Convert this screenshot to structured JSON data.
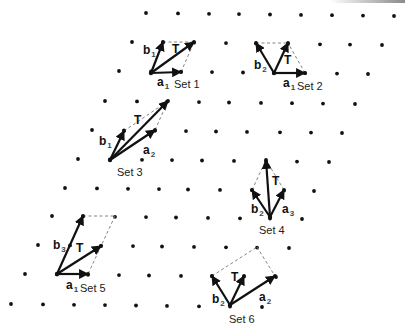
{
  "figure": {
    "width": 405,
    "height": 332,
    "colors": {
      "ink": "#111111",
      "dash": "#777777",
      "label": "#222222"
    },
    "lattice_rows": [
      {
        "y0": 13,
        "x": [
          146,
          178,
          209,
          239,
          270,
          301,
          332,
          363,
          394
        ]
      },
      {
        "y0": 42,
        "x": [
          132,
          163,
          194,
          226,
          256,
          288,
          320,
          350,
          382
        ]
      },
      {
        "y0": 71,
        "x": [
          119,
          151,
          181,
          212,
          243,
          274,
          305,
          337,
          368
        ]
      },
      {
        "y0": 101,
        "x": [
          105,
          137,
          167,
          199,
          229,
          261,
          292,
          323,
          355
        ]
      },
      {
        "y0": 130,
        "x": [
          92,
          124,
          155,
          186,
          216,
          247,
          280,
          311,
          342
        ]
      },
      {
        "y0": 159,
        "x": [
          78,
          110,
          142,
          172,
          202,
          234,
          266,
          297,
          329
        ]
      },
      {
        "y0": 188,
        "x": [
          65,
          97,
          128,
          159,
          188,
          220,
          252,
          284,
          314
        ]
      },
      {
        "y0": 216,
        "x": [
          52,
          83,
          115,
          146,
          176,
          208,
          240,
          270,
          302
        ]
      },
      {
        "y0": 245,
        "x": [
          38,
          70,
          101,
          133,
          162,
          194,
          226,
          257,
          289
        ]
      },
      {
        "y0": 274,
        "x": [
          25,
          57,
          88,
          119,
          149,
          181,
          212,
          244,
          276
        ]
      },
      {
        "y0": 304,
        "x": [
          11,
          43,
          74,
          105,
          136,
          167,
          199,
          230,
          262
        ]
      }
    ],
    "row_slope": 0.012,
    "sets": [
      {
        "label": "Set 1",
        "label_pos": [
          174,
          88
        ],
        "origin": [
          151,
          73
        ],
        "vectors": [
          {
            "name": "a",
            "sub": "1",
            "end": [
              181,
              72
            ],
            "label_pos": [
              157,
              86
            ]
          },
          {
            "name": "b",
            "sub": "1",
            "end": [
              163,
              42
            ],
            "label_pos": [
              143,
              54
            ]
          },
          {
            "name": "T",
            "sub": "",
            "end": [
              194,
              42
            ],
            "label_pos": [
              172,
              53
            ]
          }
        ],
        "dashed": [
          [
            [
              163,
              42
            ],
            [
              194,
              42
            ]
          ],
          [
            [
              181,
              72
            ],
            [
              194,
              42
            ]
          ]
        ]
      },
      {
        "label": "Set 2",
        "label_pos": [
          297,
          90
        ],
        "origin": [
          274,
          73
        ],
        "vectors": [
          {
            "name": "a",
            "sub": "1",
            "end": [
              305,
              73
            ],
            "label_pos": [
              283,
              87
            ]
          },
          {
            "name": "b",
            "sub": "2",
            "end": [
              256,
              43
            ],
            "label_pos": [
              254,
              69
            ]
          },
          {
            "name": "T",
            "sub": "",
            "end": [
              288,
              43
            ],
            "label_pos": [
              284,
              64
            ]
          }
        ],
        "dashed": [
          [
            [
              256,
              43
            ],
            [
              288,
              43
            ]
          ],
          [
            [
              305,
              73
            ],
            [
              288,
              43
            ]
          ]
        ]
      },
      {
        "label": "Set 3",
        "label_pos": [
          117,
          176
        ],
        "origin": [
          110,
          160
        ],
        "vectors": [
          {
            "name": "b",
            "sub": "1",
            "end": [
              124,
              131
            ],
            "label_pos": [
              99,
              145
            ]
          },
          {
            "name": "a",
            "sub": "2",
            "end": [
              155,
              130
            ],
            "label_pos": [
              143,
              154
            ]
          },
          {
            "name": "T",
            "sub": "",
            "end": [
              168,
              101
            ],
            "label_pos": [
              134,
              124
            ]
          }
        ],
        "dashed": [
          [
            [
              124,
              131
            ],
            [
              168,
              101
            ]
          ],
          [
            [
              155,
              130
            ],
            [
              168,
              101
            ]
          ]
        ]
      },
      {
        "label": "Set 4",
        "label_pos": [
          259,
          234
        ],
        "origin": [
          270,
          217
        ],
        "vectors": [
          {
            "name": "b",
            "sub": "2",
            "end": [
              252,
              190
            ],
            "label_pos": [
              251,
              213
            ]
          },
          {
            "name": "a",
            "sub": "3",
            "end": [
              284,
              190
            ],
            "label_pos": [
              282,
              213
            ]
          },
          {
            "name": "T",
            "sub": "",
            "end": [
              266,
              160
            ],
            "label_pos": [
              272,
              185
            ]
          }
        ],
        "dashed": [
          [
            [
              252,
              190
            ],
            [
              266,
              160
            ]
          ],
          [
            [
              284,
              190
            ],
            [
              266,
              160
            ]
          ]
        ]
      },
      {
        "label": "Set 5",
        "label_pos": [
          80,
          292
        ],
        "origin": [
          57,
          274
        ],
        "vectors": [
          {
            "name": "a",
            "sub": "1",
            "end": [
              88,
              274
            ],
            "label_pos": [
              66,
              289
            ]
          },
          {
            "name": "b",
            "sub": "3",
            "end": [
              83,
              216
            ],
            "label_pos": [
              53,
              249
            ]
          },
          {
            "name": "T",
            "sub": "",
            "end": [
              101,
              246
            ],
            "label_pos": [
              76,
              252
            ]
          }
        ],
        "dashed": [
          [
            [
              83,
              216
            ],
            [
              115,
              216
            ]
          ],
          [
            [
              115,
              216
            ],
            [
              88,
              274
            ]
          ]
        ]
      },
      {
        "label": "Set 6",
        "label_pos": [
          229,
          323
        ],
        "origin": [
          230,
          305
        ],
        "vectors": [
          {
            "name": "b",
            "sub": "2",
            "end": [
              212,
              276
            ],
            "label_pos": [
              212,
              303
            ]
          },
          {
            "name": "T",
            "sub": "",
            "end": [
              244,
              276
            ],
            "label_pos": [
              231,
              281
            ]
          },
          {
            "name": "a",
            "sub": "2",
            "end": [
              275,
              276
            ],
            "label_pos": [
              259,
              301
            ]
          }
        ],
        "dashed": [
          [
            [
              212,
              276
            ],
            [
              257,
              247
            ]
          ],
          [
            [
              257,
              247
            ],
            [
              275,
              276
            ]
          ]
        ]
      }
    ]
  }
}
